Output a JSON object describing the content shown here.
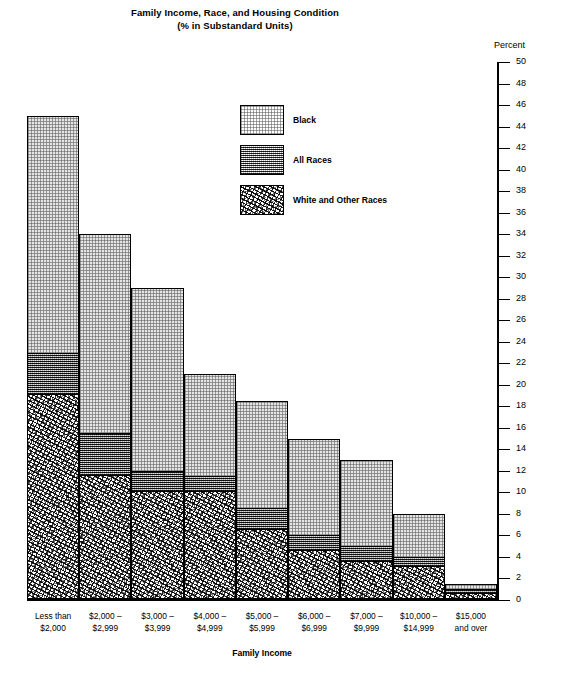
{
  "title": {
    "line1": "Family Income, Race, and Housing Condition",
    "line2": "(% in Substandard Units)"
  },
  "axis": {
    "percent_caption": "Percent",
    "xaxis_title": "Family Income"
  },
  "legend": [
    {
      "key": "black",
      "label": "Black"
    },
    {
      "key": "all_races",
      "label": "All Races"
    },
    {
      "key": "white_other",
      "label": "White and Other Races"
    }
  ],
  "chart_data": {
    "type": "bar",
    "title": "Family Income, Race, and Housing Condition (% in Substandard Units)",
    "xlabel": "Family Income",
    "ylabel": "Percent",
    "ylim": [
      0,
      50
    ],
    "ytick_step": 2,
    "yticks": [
      0,
      2,
      4,
      6,
      8,
      10,
      12,
      14,
      16,
      18,
      20,
      22,
      24,
      26,
      28,
      30,
      32,
      34,
      36,
      38,
      40,
      42,
      44,
      46,
      48,
      50
    ],
    "grid": false,
    "legend_position": "upper-center",
    "stacked_visual": "overlaid bars: Black is the full height, All Races and White and Other Races are drawn as lower bands within it",
    "categories": [
      {
        "line1": "Less than",
        "line2": "$2,000"
      },
      {
        "line1": "$2,000 –",
        "line2": "$2,999"
      },
      {
        "line1": "$3,000 –",
        "line2": "$3,999"
      },
      {
        "line1": "$4,000 –",
        "line2": "$4,999"
      },
      {
        "line1": "$5,000 –",
        "line2": "$5,999"
      },
      {
        "line1": "$6,000 –",
        "line2": "$6,999"
      },
      {
        "line1": "$7,000 –",
        "line2": "$9,999"
      },
      {
        "line1": "$10,000 –",
        "line2": "$14,999"
      },
      {
        "line1": "$15,000",
        "line2": "and over"
      }
    ],
    "series": [
      {
        "name": "Black",
        "values": [
          45,
          34,
          29,
          21,
          18.5,
          15,
          13,
          8,
          1.5
        ]
      },
      {
        "name": "All Races",
        "values": [
          23,
          15.5,
          12,
          11.5,
          8.5,
          6,
          5,
          4,
          1
        ]
      },
      {
        "name": "White and Other Races",
        "values": [
          19,
          11.5,
          10,
          10,
          6.5,
          4.5,
          3.5,
          3,
          0.5
        ]
      }
    ]
  }
}
